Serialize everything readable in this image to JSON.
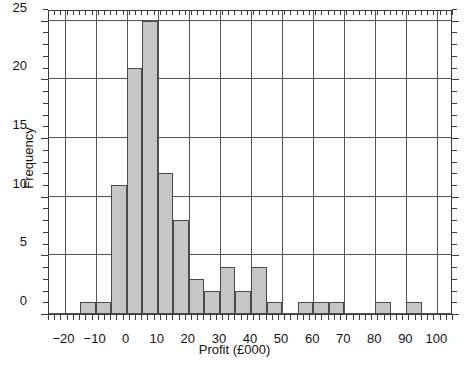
{
  "chart_data": {
    "type": "bar",
    "title": "",
    "subtitle": "",
    "xlabel": "Profit (£000)",
    "ylabel": "Frequency",
    "xlim": [
      -25,
      105
    ],
    "ylim": [
      0,
      26
    ],
    "bin_width": 5,
    "grid": true,
    "legend": null,
    "bar_fill_color": "#c6c6c6",
    "bar_edge_color": "#4a4a4a",
    "axis_color": "#3a3a3a",
    "grid_color": "#555555",
    "xticks": [
      -20,
      -10,
      0,
      10,
      20,
      30,
      40,
      50,
      60,
      70,
      80,
      90,
      100
    ],
    "xtick_labels": [
      "−20",
      "−10",
      "0",
      "10",
      "20",
      "30",
      "40",
      "50",
      "60",
      "70",
      "80",
      "90",
      "100"
    ],
    "xtick_minor_step": 2,
    "yticks": [
      0,
      5,
      10,
      15,
      20,
      25
    ],
    "ytick_labels": [
      "0",
      "5",
      "10",
      "15",
      "20",
      "25"
    ],
    "ytick_minor_step": 1,
    "bins": [
      {
        "start": -15,
        "end": -10,
        "value": 1
      },
      {
        "start": -10,
        "end": -5,
        "value": 1
      },
      {
        "start": -5,
        "end": 0,
        "value": 11
      },
      {
        "start": 0,
        "end": 5,
        "value": 21
      },
      {
        "start": 5,
        "end": 10,
        "value": 25
      },
      {
        "start": 10,
        "end": 15,
        "value": 12
      },
      {
        "start": 15,
        "end": 20,
        "value": 8
      },
      {
        "start": 20,
        "end": 25,
        "value": 3
      },
      {
        "start": 25,
        "end": 30,
        "value": 2
      },
      {
        "start": 30,
        "end": 35,
        "value": 4
      },
      {
        "start": 35,
        "end": 40,
        "value": 2
      },
      {
        "start": 40,
        "end": 45,
        "value": 4
      },
      {
        "start": 45,
        "end": 50,
        "value": 1
      },
      {
        "start": 55,
        "end": 60,
        "value": 1
      },
      {
        "start": 60,
        "end": 65,
        "value": 1
      },
      {
        "start": 65,
        "end": 70,
        "value": 1
      },
      {
        "start": 80,
        "end": 85,
        "value": 1
      },
      {
        "start": 90,
        "end": 95,
        "value": 1
      }
    ]
  }
}
